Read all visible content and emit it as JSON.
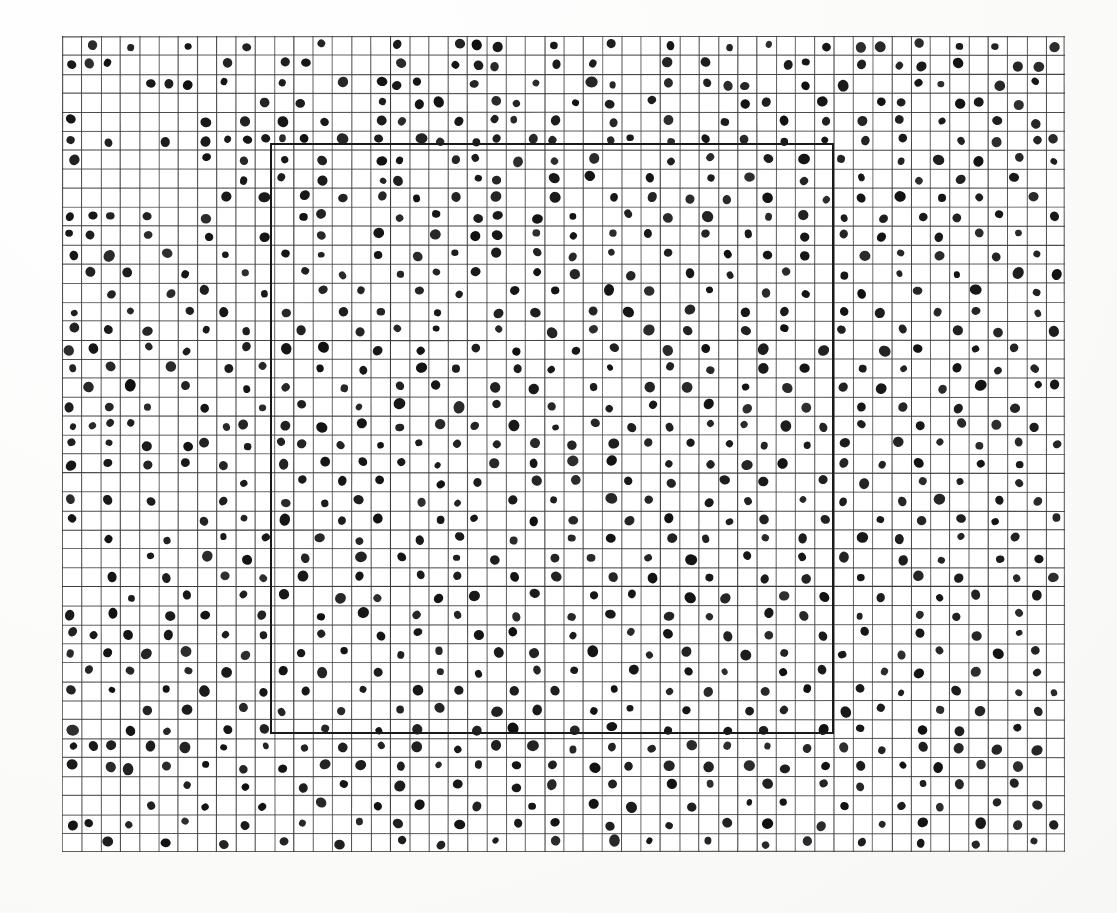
{
  "figure": {
    "title": "",
    "caption": "",
    "type": "quadrat-grid-point-pattern",
    "background_color": "#ffffff",
    "paper_color": "#fdfdfc",
    "grid_line_color": "#3a3a3a",
    "grid_line_width": 0.9,
    "dot_color": "#111111",
    "inner_rect_color": "#1a1a1a",
    "inner_rect_line_width": 2.6
  },
  "plot_area": {
    "left": 62,
    "top": 36,
    "right": 1065,
    "bottom": 852,
    "width": 1003,
    "height": 816
  },
  "grid": {
    "columns": 52,
    "rows": 43,
    "cell_width": 19.29,
    "cell_height": 18.98
  },
  "inner_rect": {
    "label": "study-subregion",
    "col_start": 11,
    "col_end": 40,
    "row_start": 6,
    "row_end": 37,
    "left": 270,
    "top": 143,
    "width": 564,
    "height": 591
  },
  "chart_data": {
    "type": "scatter",
    "title": "",
    "subtitle": "",
    "xlabel": "",
    "ylabel": "",
    "grid": true,
    "legend": "none",
    "xlim": [
      0,
      52
    ],
    "ylim": [
      0,
      43
    ],
    "marker": "filled-circle",
    "marker_size_px": 9,
    "n_columns": 52,
    "n_rows": 43,
    "occupied_cells_by_row": [
      [
        1,
        3,
        6,
        9,
        13,
        17,
        20,
        21,
        22,
        25,
        28,
        31,
        34,
        36,
        39,
        41,
        42,
        44,
        46,
        48,
        51
      ],
      [
        0,
        1,
        2,
        8,
        11,
        12,
        17,
        20,
        21,
        22,
        25,
        27,
        31,
        33,
        37,
        38,
        41,
        43,
        44,
        46,
        49,
        50
      ],
      [
        4,
        5,
        6,
        8,
        11,
        14,
        16,
        17,
        18,
        21,
        24,
        27,
        28,
        31,
        33,
        34,
        35,
        38,
        40,
        44,
        45,
        48,
        50
      ],
      [
        10,
        12,
        16,
        18,
        19,
        22,
        23,
        26,
        28,
        30,
        35,
        36,
        39,
        42,
        43,
        46,
        47,
        49
      ],
      [
        0,
        7,
        9,
        11,
        13,
        16,
        17,
        20,
        22,
        23,
        25,
        28,
        31,
        34,
        37,
        39,
        41,
        43,
        45,
        48,
        50
      ],
      [
        0,
        2,
        5,
        7,
        8,
        9,
        10,
        11,
        12,
        14,
        16,
        18,
        19,
        21,
        22,
        24,
        25,
        28,
        29,
        31,
        33,
        35,
        37,
        39,
        41,
        43,
        46,
        48,
        50,
        51
      ],
      [
        0,
        7,
        9,
        11,
        13,
        16,
        17,
        20,
        21,
        23,
        25,
        27,
        31,
        33,
        36,
        38,
        40,
        43,
        45,
        47,
        49,
        51
      ],
      [
        9,
        11,
        13,
        16,
        17,
        21,
        22,
        25,
        27,
        30,
        33,
        35,
        38,
        41,
        44,
        46,
        49
      ],
      [
        8,
        10,
        12,
        14,
        16,
        18,
        20,
        22,
        25,
        28,
        30,
        32,
        34,
        36,
        39,
        41,
        43,
        45,
        47,
        50
      ],
      [
        0,
        1,
        2,
        4,
        7,
        12,
        13,
        17,
        19,
        21,
        22,
        24,
        26,
        29,
        31,
        33,
        36,
        38,
        40,
        42,
        44,
        46,
        48,
        51
      ],
      [
        0,
        1,
        4,
        7,
        10,
        13,
        16,
        19,
        21,
        22,
        24,
        26,
        28,
        30,
        33,
        35,
        38,
        40,
        42,
        45,
        47,
        49
      ],
      [
        0,
        2,
        5,
        8,
        11,
        13,
        16,
        18,
        20,
        22,
        24,
        26,
        28,
        31,
        34,
        36,
        38,
        41,
        43,
        45,
        48,
        50
      ],
      [
        1,
        3,
        6,
        9,
        12,
        14,
        17,
        19,
        21,
        24,
        26,
        29,
        32,
        34,
        37,
        40,
        43,
        46,
        49,
        51
      ],
      [
        2,
        5,
        7,
        10,
        13,
        15,
        18,
        20,
        23,
        25,
        28,
        30,
        33,
        36,
        38,
        41,
        44,
        47,
        50
      ],
      [
        0,
        3,
        6,
        8,
        11,
        14,
        16,
        19,
        22,
        24,
        27,
        29,
        32,
        35,
        37,
        40,
        42,
        45,
        47,
        50
      ],
      [
        0,
        2,
        4,
        7,
        9,
        12,
        15,
        17,
        19,
        22,
        25,
        27,
        30,
        32,
        35,
        37,
        40,
        43,
        46,
        48,
        51
      ],
      [
        0,
        1,
        4,
        6,
        9,
        11,
        13,
        16,
        18,
        21,
        23,
        26,
        28,
        31,
        33,
        36,
        39,
        42,
        44,
        47,
        49
      ],
      [
        0,
        2,
        5,
        8,
        10,
        13,
        15,
        18,
        20,
        23,
        25,
        28,
        31,
        33,
        36,
        38,
        41,
        43,
        46,
        48,
        50
      ],
      [
        1,
        3,
        6,
        9,
        11,
        14,
        17,
        19,
        22,
        24,
        27,
        30,
        32,
        35,
        37,
        40,
        42,
        45,
        47,
        50,
        51
      ],
      [
        0,
        2,
        4,
        7,
        10,
        12,
        15,
        17,
        20,
        22,
        25,
        28,
        30,
        33,
        35,
        38,
        41,
        43,
        46,
        49
      ],
      [
        0,
        1,
        2,
        3,
        8,
        9,
        11,
        13,
        15,
        17,
        19,
        21,
        23,
        25,
        27,
        29,
        31,
        33,
        35,
        37,
        39,
        41,
        44,
        46,
        48,
        50
      ],
      [
        0,
        2,
        4,
        6,
        7,
        9,
        11,
        12,
        14,
        16,
        18,
        20,
        22,
        24,
        26,
        28,
        30,
        32,
        34,
        36,
        38,
        40,
        43,
        45,
        47,
        49,
        51
      ],
      [
        0,
        2,
        4,
        6,
        8,
        11,
        13,
        15,
        17,
        19,
        22,
        24,
        26,
        28,
        31,
        33,
        35,
        37,
        40,
        42,
        44,
        47,
        49
      ],
      [
        9,
        12,
        14,
        16,
        19,
        21,
        24,
        26,
        29,
        31,
        34,
        36,
        39,
        41,
        44,
        46,
        49
      ],
      [
        0,
        2,
        4,
        8,
        11,
        13,
        15,
        18,
        20,
        23,
        25,
        28,
        30,
        33,
        35,
        38,
        40,
        43,
        45,
        48,
        50
      ],
      [
        0,
        7,
        9,
        11,
        14,
        16,
        19,
        21,
        24,
        26,
        29,
        31,
        34,
        36,
        39,
        42,
        44,
        46,
        48,
        51
      ],
      [
        2,
        5,
        8,
        10,
        13,
        15,
        18,
        20,
        23,
        26,
        28,
        31,
        33,
        36,
        38,
        41,
        43,
        46,
        49
      ],
      [
        4,
        7,
        9,
        12,
        15,
        17,
        20,
        22,
        25,
        27,
        30,
        32,
        35,
        38,
        40,
        43,
        45,
        48,
        50
      ],
      [
        2,
        5,
        8,
        10,
        12,
        15,
        18,
        20,
        23,
        25,
        28,
        30,
        33,
        36,
        38,
        41,
        44,
        46,
        49,
        51
      ],
      [
        3,
        6,
        9,
        11,
        14,
        16,
        19,
        21,
        24,
        27,
        29,
        32,
        34,
        37,
        39,
        42,
        45,
        47,
        50
      ],
      [
        0,
        2,
        5,
        7,
        10,
        13,
        15,
        18,
        20,
        23,
        26,
        28,
        31,
        33,
        36,
        38,
        41,
        44,
        46,
        49
      ],
      [
        0,
        1,
        3,
        5,
        8,
        10,
        13,
        16,
        18,
        21,
        23,
        26,
        29,
        31,
        34,
        36,
        39,
        41,
        44,
        47,
        49
      ],
      [
        0,
        2,
        4,
        6,
        9,
        12,
        14,
        17,
        19,
        22,
        24,
        27,
        30,
        32,
        35,
        37,
        40,
        43,
        45,
        48,
        50
      ],
      [
        1,
        3,
        6,
        8,
        11,
        13,
        16,
        19,
        21,
        24,
        26,
        29,
        32,
        34,
        37,
        39,
        42,
        44,
        47,
        50
      ],
      [
        0,
        2,
        5,
        7,
        10,
        12,
        15,
        18,
        20,
        23,
        25,
        28,
        31,
        33,
        36,
        38,
        41,
        43,
        46,
        49,
        51
      ],
      [
        4,
        6,
        9,
        11,
        14,
        17,
        19,
        22,
        24,
        27,
        29,
        32,
        35,
        37,
        40,
        42,
        45,
        47,
        50
      ],
      [
        0,
        3,
        5,
        8,
        10,
        13,
        16,
        18,
        21,
        23,
        26,
        28,
        31,
        34,
        36,
        39,
        41,
        44,
        46,
        49
      ],
      [
        0,
        1,
        2,
        4,
        6,
        8,
        10,
        12,
        14,
        16,
        18,
        20,
        22,
        24,
        26,
        28,
        30,
        32,
        34,
        36,
        38,
        40,
        42,
        44,
        46,
        48,
        50
      ],
      [
        0,
        2,
        3,
        5,
        7,
        9,
        11,
        13,
        15,
        17,
        19,
        21,
        23,
        25,
        27,
        29,
        31,
        33,
        35,
        37,
        39,
        41,
        43,
        45,
        47,
        49
      ],
      [
        6,
        9,
        12,
        14,
        17,
        20,
        23,
        25,
        28,
        31,
        33,
        36,
        39,
        41,
        44,
        46,
        49
      ],
      [
        4,
        7,
        10,
        13,
        16,
        18,
        21,
        24,
        27,
        29,
        32,
        35,
        37,
        40,
        43,
        45,
        48,
        50
      ],
      [
        0,
        1,
        3,
        6,
        9,
        12,
        15,
        17,
        20,
        23,
        25,
        28,
        31,
        34,
        36,
        39,
        42,
        44,
        47,
        49,
        51
      ],
      [
        2,
        5,
        8,
        11,
        14,
        17,
        19,
        22,
        25,
        28,
        30,
        33,
        36,
        38,
        41,
        44,
        47,
        50
      ]
    ]
  }
}
